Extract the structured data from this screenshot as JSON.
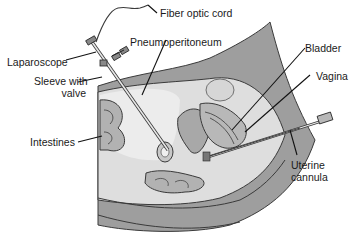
{
  "diagram": {
    "type": "medical-illustration",
    "labels": {
      "fiber_optic_cord": "Fiber optic cord",
      "laparoscope": "Laparoscope",
      "pneumoperitoneum": "Pneumoperitoneum",
      "sleeve_line1": "Sleeve with",
      "sleeve_line2": "valve",
      "bladder": "Bladder",
      "vagina": "Vagina",
      "intestines": "Intestines",
      "uterine_line1": "Uterine",
      "uterine_line2": "cannula"
    },
    "colors": {
      "body_dark": "#9a9a9a",
      "body_mid": "#c4c4c4",
      "cavity_light": "#e2e2e2",
      "organ_fill": "#b0b0b0",
      "outline": "#3a3a3a",
      "leader": "#111111"
    }
  }
}
